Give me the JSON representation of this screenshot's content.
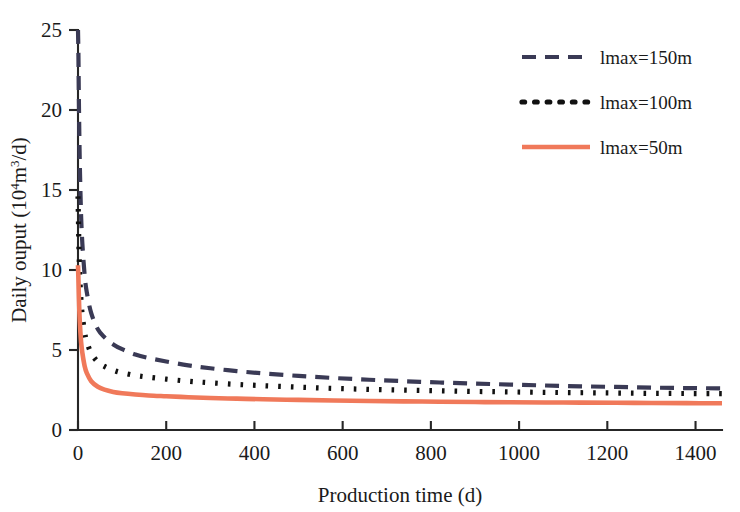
{
  "chart_data": {
    "type": "line",
    "title": "",
    "xlabel": "Production time (d)",
    "ylabel": "Daily ouput (10⁴m³/d)",
    "ylabel_parts": {
      "prefix": "Daily ouput (10",
      "exponent": "4",
      "middle": "m",
      "exponent2": "3",
      "suffix": "/d)"
    },
    "xlim": [
      0,
      1460
    ],
    "ylim": [
      0,
      25
    ],
    "xticks": [
      0,
      200,
      400,
      600,
      800,
      1000,
      1200,
      1400
    ],
    "xtick_labels": [
      "0",
      "200",
      "400",
      "600",
      "800",
      "1000",
      "1200",
      "1400"
    ],
    "yticks": [
      0,
      5,
      10,
      15,
      20,
      25
    ],
    "ytick_labels": [
      "0",
      "5",
      "10",
      "15",
      "20",
      "25"
    ],
    "grid": false,
    "legend_position": "top-right",
    "series": [
      {
        "name": "lmax=150m",
        "color": "#3a3a55",
        "style": "dashed",
        "dash_pattern": "14,9",
        "width": 4.2,
        "x": [
          0,
          1,
          2,
          4,
          7,
          10,
          15,
          20,
          30,
          45,
          60,
          80,
          100,
          130,
          160,
          200,
          250,
          300,
          360,
          420,
          500,
          580,
          660,
          740,
          820,
          900,
          980,
          1060,
          1140,
          1220,
          1300,
          1380,
          1460
        ],
        "y": [
          25.0,
          23.4,
          20.6,
          16.8,
          13.4,
          11.6,
          9.7,
          8.6,
          7.3,
          6.3,
          5.8,
          5.35,
          5.05,
          4.72,
          4.5,
          4.28,
          4.04,
          3.86,
          3.68,
          3.54,
          3.38,
          3.25,
          3.14,
          3.05,
          2.97,
          2.9,
          2.84,
          2.78,
          2.73,
          2.69,
          2.65,
          2.62,
          2.6
        ]
      },
      {
        "name": "lmax=100m",
        "color": "#111111",
        "style": "dotted",
        "dash_pattern": "2.6,10",
        "width": 5.2,
        "x": [
          0,
          1,
          2,
          4,
          7,
          10,
          15,
          20,
          30,
          45,
          60,
          80,
          100,
          130,
          160,
          200,
          250,
          300,
          360,
          420,
          500,
          580,
          660,
          740,
          820,
          900,
          980,
          1060,
          1140,
          1220,
          1300,
          1380,
          1460
        ],
        "y": [
          14.6,
          13.2,
          11.6,
          9.6,
          8.0,
          7.1,
          6.1,
          5.5,
          4.8,
          4.25,
          3.98,
          3.74,
          3.58,
          3.41,
          3.3,
          3.18,
          3.05,
          2.95,
          2.85,
          2.77,
          2.68,
          2.6,
          2.54,
          2.49,
          2.45,
          2.41,
          2.38,
          2.35,
          2.33,
          2.31,
          2.29,
          2.28,
          2.27
        ]
      },
      {
        "name": "lmax=50m",
        "color": "#f0795a",
        "style": "solid",
        "dash_pattern": "",
        "width": 4.6,
        "x": [
          0,
          1,
          2,
          4,
          7,
          10,
          15,
          20,
          30,
          45,
          60,
          80,
          100,
          130,
          160,
          200,
          250,
          300,
          360,
          420,
          500,
          580,
          660,
          740,
          820,
          900,
          980,
          1060,
          1140,
          1220,
          1300,
          1380,
          1460
        ],
        "y": [
          10.3,
          9.4,
          8.3,
          6.8,
          5.5,
          4.8,
          4.0,
          3.55,
          3.05,
          2.7,
          2.52,
          2.38,
          2.3,
          2.22,
          2.16,
          2.11,
          2.05,
          2.0,
          1.96,
          1.92,
          1.88,
          1.84,
          1.81,
          1.79,
          1.77,
          1.75,
          1.73,
          1.72,
          1.71,
          1.7,
          1.69,
          1.68,
          1.67
        ]
      }
    ]
  },
  "legend": {
    "items": [
      {
        "label": "lmax=150m"
      },
      {
        "label": "lmax=100m"
      },
      {
        "label": "lmax=50m"
      }
    ]
  },
  "axes": {
    "x_title": "Production time (d)",
    "y_title": "Daily ouput (10⁴m³/d)"
  },
  "colors": {
    "series_150": "#3a3a55",
    "series_100": "#111111",
    "series_50": "#f0795a",
    "axis": "#262626",
    "background": "#ffffff"
  }
}
